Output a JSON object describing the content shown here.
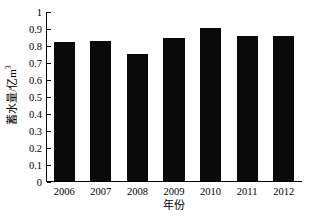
{
  "chart_data": {
    "type": "bar",
    "title": "",
    "xlabel": "年份",
    "ylabel": "蓄水量/亿m³",
    "ylabel_main": "蓄水量/亿m",
    "ylabel_sup": "3",
    "categories": [
      "2006",
      "2007",
      "2008",
      "2009",
      "2010",
      "2011",
      "2012"
    ],
    "values": [
      0.82,
      0.825,
      0.75,
      0.84,
      0.9,
      0.855,
      0.855
    ],
    "series": [
      {
        "name": "蓄水量",
        "values": [
          0.82,
          0.825,
          0.75,
          0.84,
          0.9,
          0.855,
          0.855
        ]
      }
    ],
    "ylim": [
      0,
      1
    ],
    "ytick_labels": [
      "0",
      "0.1",
      "0.2",
      "0.3",
      "0.4",
      "0.5",
      "0.6",
      "0.7",
      "0.8",
      "0.9",
      "1"
    ],
    "ytick_values": [
      0,
      0.1,
      0.2,
      0.3,
      0.4,
      0.5,
      0.6,
      0.7,
      0.8,
      0.9,
      1
    ],
    "grid": false,
    "legend": false,
    "bar_color": "#0a0a0a",
    "background_color": "#ffffff",
    "axis_color": "#000000"
  }
}
